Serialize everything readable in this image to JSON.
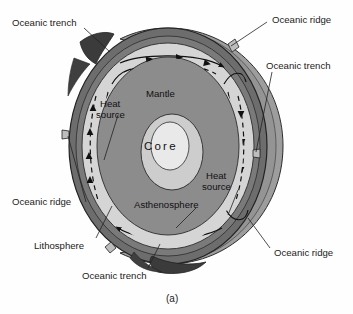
{
  "figure": {
    "caption": "(a)"
  },
  "interior_labels": {
    "mantle": "Mantle",
    "core": "Core",
    "asthenosphere": "Asthenosphere",
    "heat_source_upper": "Heat\nsource",
    "heat_source_upper_line1": "Heat",
    "heat_source_upper_line2": "source",
    "heat_source_lower_line1": "Heat",
    "heat_source_lower_line2": "source"
  },
  "callouts": [
    {
      "id": "oceanic-trench-top-left",
      "label": "Oceanic trench"
    },
    {
      "id": "oceanic-ridge-top-right",
      "label": "Oceanic ridge"
    },
    {
      "id": "oceanic-trench-right",
      "label": "Oceanic trench"
    },
    {
      "id": "oceanic-ridge-left",
      "label": "Oceanic ridge"
    },
    {
      "id": "lithosphere-left",
      "label": "Lithosphere"
    },
    {
      "id": "oceanic-trench-bottom",
      "label": "Oceanic trench"
    },
    {
      "id": "oceanic-ridge-bottom-right",
      "label": "Oceanic ridge"
    }
  ],
  "colors": {
    "background": "#fefefe",
    "body_far": "#9a9a9a",
    "body_rim": "#8d8d8d",
    "lithosphere": "#6f6f6f",
    "lithosphere_dark": "#4a4a4a",
    "asthenosphere": "#d3d3d3",
    "mantle": "#8a8a8a",
    "core_outer": "#cccccc",
    "core_inner": "#e8e8e8",
    "trench_dark": "#3a3a3a",
    "stroke": "#222222",
    "text": "#1b1b1b"
  }
}
